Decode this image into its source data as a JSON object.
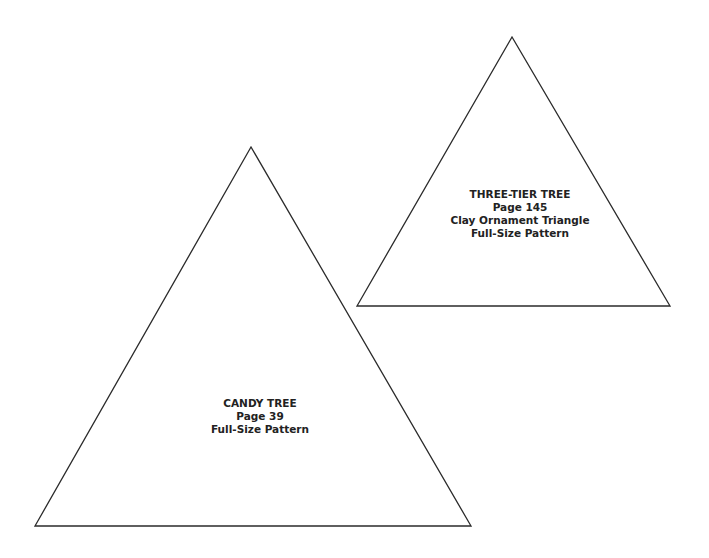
{
  "patterns": [
    {
      "id": "three-tier-tree",
      "lines": [
        "THREE-TIER TREE",
        "Page 145",
        "Clay Ornament Triangle",
        "Full-Size Pattern"
      ],
      "triangle": {
        "apex": [
          512,
          37
        ],
        "left": [
          357,
          306
        ],
        "right": [
          670,
          306
        ]
      }
    },
    {
      "id": "candy-tree",
      "lines": [
        "CANDY TREE",
        "Page 39",
        "Full-Size Pattern"
      ],
      "triangle": {
        "apex": [
          251,
          147
        ],
        "left": [
          35,
          526
        ],
        "right": [
          471,
          526
        ]
      }
    }
  ],
  "colors": {
    "stroke": "#2b2b2b",
    "text": "#222222",
    "background": "#ffffff"
  }
}
